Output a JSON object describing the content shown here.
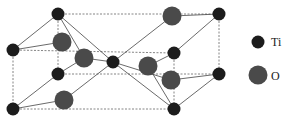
{
  "diagram": {
    "type": "crystal-unit-cell",
    "colors": {
      "ti": "#1c1c1c",
      "o": "#4a4a4a",
      "edge": "#555555",
      "bond": "#444444"
    },
    "legend": [
      {
        "symbol": "Ti",
        "label": "Ti"
      },
      {
        "symbol": "O",
        "label": "O"
      }
    ]
  }
}
